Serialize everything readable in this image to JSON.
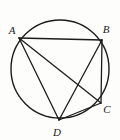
{
  "figure": {
    "background_color": "#fdfdfc",
    "stroke_color": "#1c1c1c",
    "label_color": "#1a1a1a",
    "circle": {
      "name": "circumscribed-circle",
      "center_x": 60,
      "center_y": 69,
      "radius": 49,
      "stroke_width": 1.4
    },
    "points": [
      {
        "id": "A",
        "label": "A",
        "x": 19,
        "y": 38,
        "label_x": 12,
        "label_y": 34
      },
      {
        "id": "B",
        "label": "B",
        "x": 102,
        "y": 40,
        "label_x": 104,
        "label_y": 33
      },
      {
        "id": "C",
        "label": "C",
        "x": 101,
        "y": 103,
        "label_x": 104,
        "label_y": 113
      },
      {
        "id": "D",
        "label": "D",
        "x": 59,
        "y": 120,
        "label_x": 55,
        "label_y": 135
      }
    ],
    "segments": [
      {
        "id": "AB",
        "from": "A",
        "to": "B",
        "x1": 19,
        "y1": 38,
        "x2": 102,
        "y2": 40
      },
      {
        "id": "AC",
        "from": "A",
        "to": "C",
        "x1": 19,
        "y1": 38,
        "x2": 101,
        "y2": 103
      },
      {
        "id": "AD",
        "from": "A",
        "to": "D",
        "x1": 19,
        "y1": 38,
        "x2": 59,
        "y2": 120
      },
      {
        "id": "BC",
        "from": "B",
        "to": "C",
        "x1": 102,
        "y1": 40,
        "x2": 101,
        "y2": 103
      },
      {
        "id": "BD",
        "from": "B",
        "to": "D",
        "x1": 102,
        "y1": 40,
        "x2": 59,
        "y2": 120
      },
      {
        "id": "CD",
        "from": "C",
        "to": "D",
        "x1": 101,
        "y1": 103,
        "x2": 59,
        "y2": 120
      }
    ]
  }
}
